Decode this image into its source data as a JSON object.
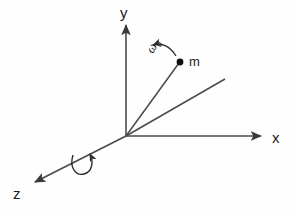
{
  "figure": {
    "kind": "3d-axes-physics-diagram",
    "background_color": "#fefefe",
    "ink_color": "#3a3a3a",
    "text_color": "#1a1a1a"
  },
  "axes": {
    "y": {
      "label": "y",
      "direction": "up",
      "origin": [
        126,
        136
      ],
      "tip": [
        126,
        22
      ],
      "arrowhead": true
    },
    "x": {
      "label": "x",
      "direction": "right",
      "origin": [
        126,
        136
      ],
      "tip": [
        264,
        136
      ],
      "arrowhead": true
    },
    "z": {
      "label": "z",
      "direction": "down-left",
      "origin": [
        126,
        136
      ],
      "tip": [
        31,
        184
      ],
      "arrowhead": true
    }
  },
  "mass": {
    "label": "m",
    "point": [
      180,
      62
    ],
    "dot_radius": 3.2
  },
  "rod": {
    "from": [
      126,
      136
    ],
    "to": [
      180,
      62
    ],
    "labelled": false
  },
  "reference_line": {
    "from": [
      126,
      136
    ],
    "to": [
      225,
      79
    ],
    "arrowhead": false,
    "labelled": false
  },
  "angular_velocity": {
    "label": "ω",
    "subscript": "0",
    "full_label": "ω0",
    "arc_from": [
      175,
      55
    ],
    "arc_to": [
      152,
      47
    ],
    "arrowhead": true,
    "arrowhead_direction": "left"
  },
  "spin_indicator": {
    "name": "rotation-about-z",
    "center": [
      82,
      163
    ],
    "loop_radius": 9,
    "arrowhead": true,
    "about_axis": "z"
  }
}
